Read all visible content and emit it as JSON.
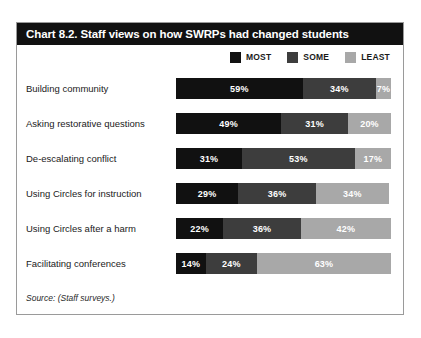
{
  "chart_data": {
    "type": "bar",
    "subtype": "stacked-horizontal-100",
    "title": "Chart 8.2. Staff views on how SWRPs had changed students",
    "xlabel": "",
    "ylabel": "",
    "xlim": [
      0,
      100
    ],
    "grid": false,
    "legend_position": "top-right",
    "source": "Source: (Staff surveys.)",
    "categories": [
      "Building community",
      "Asking restorative questions",
      "De-escalating conflict",
      "Using Circles for instruction",
      "Using Circles after a harm",
      "Facilitating conferences"
    ],
    "series": [
      {
        "name": "MOST",
        "color": "#111111",
        "values": [
          59,
          49,
          31,
          29,
          22,
          14
        ]
      },
      {
        "name": "SOME",
        "color": "#3d3d3d",
        "values": [
          34,
          31,
          53,
          36,
          36,
          24
        ]
      },
      {
        "name": "LEAST",
        "color": "#a8a8a8",
        "values": [
          7,
          20,
          17,
          34,
          42,
          63
        ]
      }
    ],
    "value_labels": [
      [
        "59%",
        "34%",
        "7%"
      ],
      [
        "49%",
        "31%",
        "20%"
      ],
      [
        "31%",
        "53%",
        "17%"
      ],
      [
        "29%",
        "36%",
        "34%"
      ],
      [
        "22%",
        "36%",
        "42%"
      ],
      [
        "14%",
        "24%",
        "63%"
      ]
    ]
  },
  "colors": {
    "most": "#111111",
    "some": "#3d3d3d",
    "least": "#a8a8a8",
    "frame_border": "#9a9a9a",
    "title_bar": "#111111",
    "title_text": "#ffffff"
  }
}
